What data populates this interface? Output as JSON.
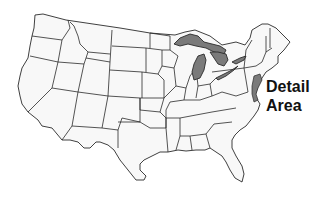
{
  "map": {
    "title": "Contiguous United States",
    "label_lines": [
      "Detail",
      "Area"
    ],
    "highlighted_features": [
      "Great Lakes",
      "Lake Ontario / Lake Erie shoreline",
      "Mid-Atlantic coastal detail area"
    ],
    "colors": {
      "background": "#ffffff",
      "state_fill": "#f8f8f8",
      "state_border": "#2a2a2a",
      "highlight_fill": "#7a7a7a",
      "label": "#111111"
    }
  }
}
